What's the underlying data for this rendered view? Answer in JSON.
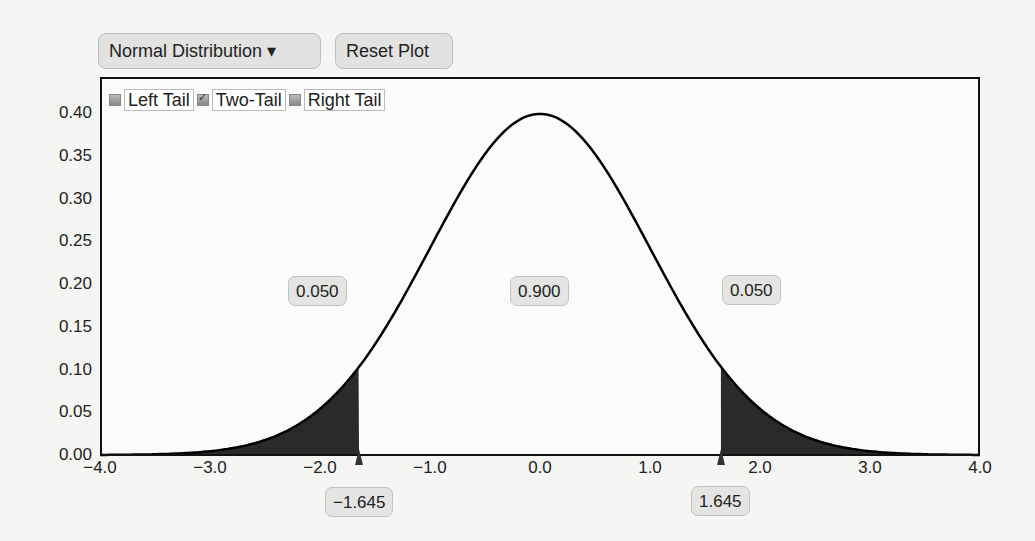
{
  "toolbar": {
    "distribution_label": "Normal Distribution ▾",
    "reset_label": "Reset Plot"
  },
  "tail_options": [
    {
      "label": "Left Tail",
      "checked": false
    },
    {
      "label": "Two-Tail",
      "checked": true
    },
    {
      "label": "Right Tail",
      "checked": false
    }
  ],
  "areas": {
    "left": "0.050",
    "center": "0.900",
    "right": "0.050"
  },
  "critical_values": {
    "lower": "−1.645",
    "upper": "1.645"
  },
  "axis": {
    "y_ticks": [
      "0.40",
      "0.35",
      "0.30",
      "0.25",
      "0.20",
      "0.15",
      "0.10",
      "0.05",
      "0.00"
    ],
    "x_ticks": [
      "−4.0",
      "−3.0",
      "−2.0",
      "−1.0",
      "0.0",
      "1.0",
      "2.0",
      "3.0",
      "4.0"
    ]
  },
  "colors": {
    "shade": "#2a2a2a",
    "curve": "#000000",
    "pill_bg": "#e4e4e2"
  },
  "chart_data": {
    "type": "area",
    "title": "Normal Distribution",
    "distribution": "standard normal (mean 0, sd 1)",
    "xlim": [
      -4.0,
      4.0
    ],
    "ylim": [
      0.0,
      0.4
    ],
    "x_ticks": [
      -4.0,
      -3.0,
      -2.0,
      -1.0,
      0.0,
      1.0,
      2.0,
      3.0,
      4.0
    ],
    "y_ticks": [
      0.0,
      0.05,
      0.1,
      0.15,
      0.2,
      0.25,
      0.3,
      0.35,
      0.4
    ],
    "mode": "Two-Tail",
    "critical_values": [
      -1.645,
      1.645
    ],
    "shaded_regions": [
      {
        "from": -4.0,
        "to": -1.645,
        "area": 0.05
      },
      {
        "from": 1.645,
        "to": 4.0,
        "area": 0.05
      }
    ],
    "center_area": 0.9,
    "peak": {
      "x": 0.0,
      "y": 0.399
    },
    "density_at_critical": 0.103,
    "grid": false,
    "legend": "none"
  }
}
